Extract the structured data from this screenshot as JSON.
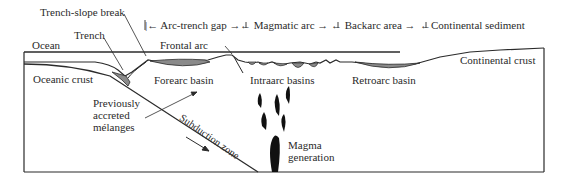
{
  "diagram": {
    "zones_header": [
      {
        "label": "Arc-trench gap"
      },
      {
        "label": "Magmatic arc"
      },
      {
        "label": "Backarc area"
      },
      {
        "label": "Continental sediment"
      }
    ],
    "labels": {
      "trench_slope_break": "Trench-slope break",
      "trench": "Trench",
      "ocean": "Ocean",
      "frontal_arc": "Frontal arc",
      "oceanic_crust": "Oceanic crust",
      "forearc_basin": "Forearc basin",
      "intraarc_basins": "Intraarc basins",
      "retroarc_basin": "Retroarc basin",
      "continental_crust": "Continental crust",
      "melanges_line1": "Previously",
      "melanges_line2": "accreted",
      "melanges_line3": "mélanges",
      "subduction_zone": "Subduction zone",
      "magma_line1": "Magma",
      "magma_line2": "generation"
    },
    "colors": {
      "line": "#2b2b2b",
      "sediment_fill": "#8a8a8a",
      "magma_fill": "#111111",
      "background": "#ffffff"
    }
  }
}
